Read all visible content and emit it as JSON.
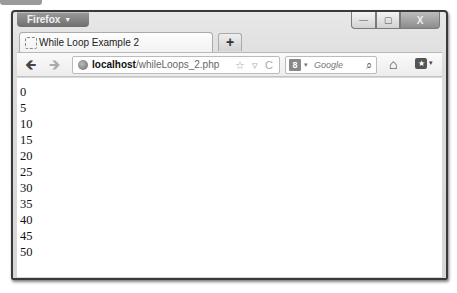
{
  "window": {
    "app_button": "Firefox",
    "controls": {
      "minimize": "—",
      "maximize": "▢",
      "close": "X"
    }
  },
  "tabs": [
    {
      "title": "While Loop Example 2",
      "active": true
    }
  ],
  "new_tab_label": "+",
  "navbar": {
    "back_icon": "🡸",
    "forward_icon": "🡺",
    "url_host": "localhost",
    "url_path": "/whileLoops_2.php",
    "url_icons": "☆ ▿ C",
    "search_engine_glyph": "8",
    "search_dropdown": "▾",
    "search_placeholder": "Google",
    "search_icon": "⌕",
    "home_icon": "⌂",
    "bookmarks_icon": "★",
    "bookmarks_arrow": "▾"
  },
  "content": {
    "lines": [
      "0",
      "5",
      "10",
      "15",
      "20",
      "25",
      "30",
      "35",
      "40",
      "45",
      "50"
    ]
  }
}
